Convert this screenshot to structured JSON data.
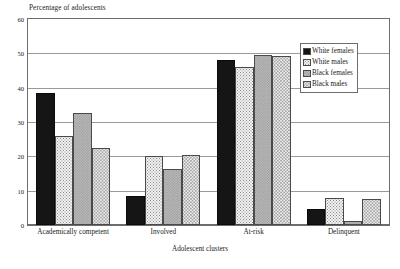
{
  "chart_data": {
    "type": "bar",
    "title": "",
    "ylabel": "Percentage of adolescents",
    "xlabel": "Adolescent clusters",
    "ylim": [
      0,
      60
    ],
    "yticks": [
      0,
      10,
      20,
      30,
      40,
      50,
      60
    ],
    "ytick_labels": [
      "0",
      "10",
      "20",
      "30",
      "40",
      "50",
      "60"
    ],
    "grid": true,
    "legend_position": "top-right",
    "categories": [
      "Academically competent",
      "Involved",
      "At-risk",
      "Delinquent"
    ],
    "series": [
      {
        "name": "White females",
        "pattern": "solid-black",
        "color": "#151515",
        "values": [
          38.5,
          8.5,
          48.2,
          4.8
        ]
      },
      {
        "name": "White males",
        "pattern": "light-dotted",
        "color": "#f2f2f2",
        "values": [
          25.8,
          20.2,
          46.0,
          7.8
        ]
      },
      {
        "name": "Black females",
        "pattern": "gray-checkered",
        "color": "#b9b9b9",
        "values": [
          32.5,
          16.3,
          49.6,
          1.2
        ]
      },
      {
        "name": "Black males",
        "pattern": "pale-dotted",
        "color": "#ededed",
        "values": [
          22.5,
          20.3,
          49.2,
          7.5
        ]
      }
    ]
  }
}
